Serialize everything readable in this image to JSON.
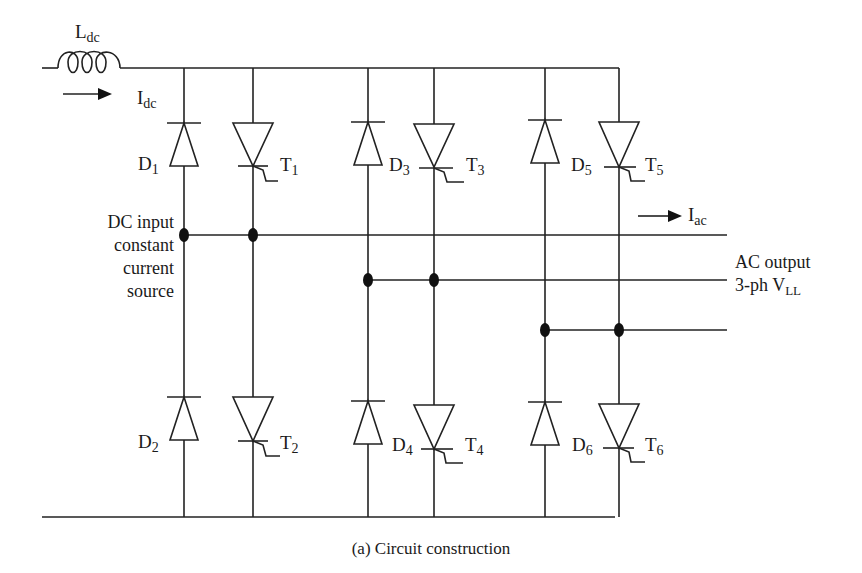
{
  "diagram": {
    "type": "circuit-schematic",
    "caption": "(a) Circuit construction",
    "inductor": {
      "symbol": "L",
      "subscript": "dc"
    },
    "dc_current": {
      "symbol": "I",
      "subscript": "dc"
    },
    "ac_current": {
      "symbol": "I",
      "subscript": "ac"
    },
    "source_label": [
      "DC input",
      "constant",
      "current",
      "source"
    ],
    "output_label": {
      "line1": "AC output",
      "line2_prefix": "3-ph V",
      "line2_subscript": "LL"
    },
    "devices": [
      {
        "id": "D1",
        "kind": "diode",
        "letter": "D",
        "num": "1",
        "position": "upper"
      },
      {
        "id": "T1",
        "kind": "thyristor",
        "letter": "T",
        "num": "1",
        "position": "upper"
      },
      {
        "id": "D3",
        "kind": "diode",
        "letter": "D",
        "num": "3",
        "position": "upper"
      },
      {
        "id": "T3",
        "kind": "thyristor",
        "letter": "T",
        "num": "3",
        "position": "upper"
      },
      {
        "id": "D5",
        "kind": "diode",
        "letter": "D",
        "num": "5",
        "position": "upper"
      },
      {
        "id": "T5",
        "kind": "thyristor",
        "letter": "T",
        "num": "5",
        "position": "upper"
      },
      {
        "id": "D2",
        "kind": "diode",
        "letter": "D",
        "num": "2",
        "position": "lower"
      },
      {
        "id": "T2",
        "kind": "thyristor",
        "letter": "T",
        "num": "2",
        "position": "lower"
      },
      {
        "id": "D4",
        "kind": "diode",
        "letter": "D",
        "num": "4",
        "position": "lower"
      },
      {
        "id": "T4",
        "kind": "thyristor",
        "letter": "T",
        "num": "4",
        "position": "lower"
      },
      {
        "id": "D6",
        "kind": "diode",
        "letter": "D",
        "num": "6",
        "position": "lower"
      },
      {
        "id": "T6",
        "kind": "thyristor",
        "letter": "T",
        "num": "6",
        "position": "lower"
      }
    ],
    "colors": {
      "line": "#222222",
      "background": "#ffffff"
    }
  }
}
